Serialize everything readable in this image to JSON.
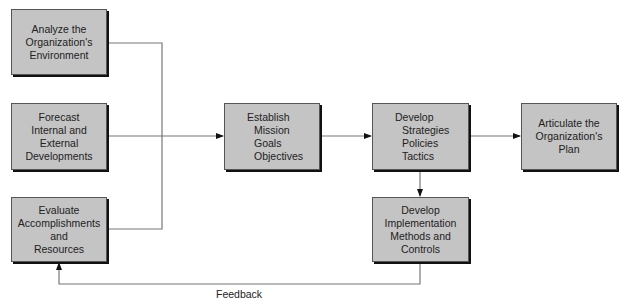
{
  "boxes": {
    "analyze": [
      "Analyze the",
      "Organization's",
      "Environment"
    ],
    "forecast": [
      "Forecast",
      "Internal and",
      "External",
      "Developments"
    ],
    "evaluate": [
      "Evaluate",
      "Accomplishments",
      "and",
      "Resources"
    ],
    "establish": {
      "title": "Establish",
      "items": [
        "Mission",
        "Goals",
        "Objectives"
      ]
    },
    "develop_strategies": {
      "title": "Develop",
      "items": [
        "Strategies",
        "Policies",
        "Tactics"
      ]
    },
    "articulate": [
      "Articulate the",
      "Organization's",
      "Plan"
    ],
    "implementation": [
      "Develop",
      "Implementation",
      "Methods and",
      "Controls"
    ]
  },
  "feedback_label": "Feedback",
  "colors": {
    "box_fill": "#c4c4c4",
    "line": "#777777",
    "shadow": "#111111"
  }
}
